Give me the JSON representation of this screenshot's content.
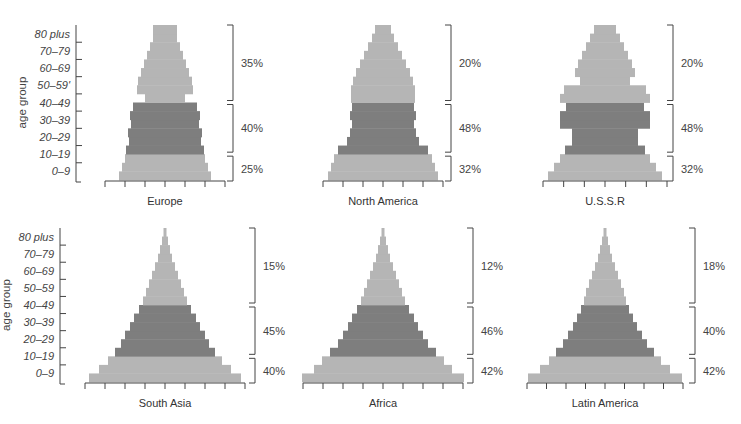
{
  "chart_data": {
    "type": "bar",
    "subtype": "population-pyramid",
    "ylabel": "age group",
    "age_labels": [
      "0-9",
      "10-19",
      "20-29",
      "30-39",
      "40-49",
      "50-59",
      "60-69",
      "70-79",
      "80 plus"
    ],
    "age_labels_display_top": [
      "0–9",
      "10–19",
      "20–29",
      "30–39",
      "40–49",
      "50–59'",
      "60–69",
      "70–79",
      "80 plus"
    ],
    "age_labels_display_bottom": [
      "0–9",
      "10–19",
      "20–29",
      "30–39",
      "40–49",
      "50–59",
      "60–69",
      "70–79",
      "80 plus"
    ],
    "row_bins": "18 five-year rows from 0-4 (bottom) to 80+ (top); values are relative half-widths",
    "colors": {
      "young_old": "#b5b5b5",
      "working": "#7e7e7e",
      "axis": "#444444"
    },
    "charts": [
      {
        "title": "Europe",
        "widths": [
          46,
          43,
          40,
          39,
          36,
          37,
          34,
          35,
          32,
          20,
          28,
          27,
          24,
          21,
          18,
          15,
          12,
          12
        ],
        "split": [
          3,
          9
        ],
        "groups": [
          {
            "range": "young",
            "pct": "25%"
          },
          {
            "range": "working",
            "pct": "40%"
          },
          {
            "range": "old",
            "pct": "35%"
          }
        ]
      },
      {
        "title": "North America",
        "widths": [
          55,
          52,
          49,
          45,
          36,
          33,
          31,
          33,
          31,
          32,
          32,
          30,
          27,
          23,
          19,
          15,
          11,
          8
        ],
        "split": [
          3,
          9
        ],
        "groups": [
          {
            "range": "young",
            "pct": "32%"
          },
          {
            "range": "working",
            "pct": "48%"
          },
          {
            "range": "old",
            "pct": "20%"
          }
        ]
      },
      {
        "title": "U.S.S.R",
        "widths": [
          57,
          51,
          45,
          40,
          33,
          33,
          45,
          45,
          39,
          45,
          41,
          25,
          30,
          27,
          23,
          19,
          15,
          11
        ],
        "split": [
          3,
          9
        ],
        "groups": [
          {
            "range": "young",
            "pct": "32%"
          },
          {
            "range": "working",
            "pct": "48%"
          },
          {
            "range": "old",
            "pct": "20%"
          }
        ]
      },
      {
        "title": "South Asia",
        "widths": [
          76,
          66,
          57,
          50,
          44,
          40,
          35,
          31,
          26,
          22,
          19,
          16,
          13,
          10,
          7,
          5,
          3,
          1.5
        ],
        "split": [
          3,
          9
        ],
        "groups": [
          {
            "range": "young",
            "pct": "40%"
          },
          {
            "range": "working",
            "pct": "45%"
          },
          {
            "range": "old",
            "pct": "15%"
          }
        ]
      },
      {
        "title": "Africa",
        "widths": [
          81,
          69,
          61,
          53,
          45,
          40,
          35,
          31,
          26,
          22,
          19,
          16,
          13,
          10,
          7,
          5,
          3,
          1.5
        ],
        "split": [
          3,
          9
        ],
        "groups": [
          {
            "range": "young",
            "pct": "42%"
          },
          {
            "range": "working",
            "pct": "46%"
          },
          {
            "range": "old",
            "pct": "12%"
          }
        ]
      },
      {
        "title": "Latin America",
        "widths": [
          77,
          65,
          56,
          49,
          42,
          37,
          32,
          28,
          24,
          21,
          19,
          16,
          13,
          10,
          7,
          5,
          3,
          1.5
        ],
        "split": [
          3,
          9
        ],
        "groups": [
          {
            "range": "young",
            "pct": "42%"
          },
          {
            "range": "working",
            "pct": "40%"
          },
          {
            "range": "old",
            "pct": "18%"
          }
        ]
      }
    ]
  }
}
